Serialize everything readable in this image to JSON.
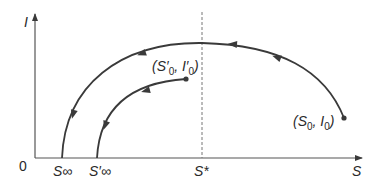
{
  "axes": {
    "x_label": "S",
    "y_label": "I",
    "origin_label": "0"
  },
  "ticks": {
    "s_inf": "S∞",
    "s_inf_prime": "S′∞",
    "s_star": "S*"
  },
  "points": {
    "start_outer": {
      "base": "(S",
      "sub1": "0",
      "mid": ", I",
      "sub2": "0",
      "end": ")"
    },
    "start_inner": {
      "base": "(S′",
      "sub1": "0",
      "mid": ", I′",
      "sub2": "0",
      "end": ")"
    }
  },
  "colors": {
    "stroke": "#3a3a3a",
    "dash": "#777777"
  }
}
